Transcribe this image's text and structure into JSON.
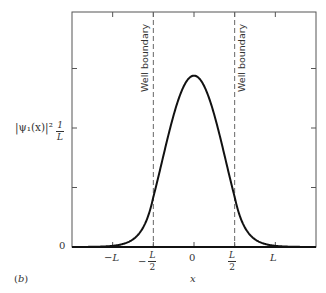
{
  "figure": {
    "panel_label": "(b)",
    "x_axis_label": "x",
    "y_axis_label": "|ψ₁(x)|²",
    "boundary_label": "Well boundary"
  },
  "chart_data": {
    "type": "line",
    "title": "",
    "panel": "(b)",
    "xlabel": "x",
    "ylabel": "|ψ₁(x)|²",
    "x_unit": "L",
    "y_unit": "1/L",
    "xlim": [
      -1.5,
      1.5
    ],
    "ylim": [
      0,
      2.0
    ],
    "grid": false,
    "legend": null,
    "x_ticks": [
      {
        "value": -1.0,
        "label": "-L"
      },
      {
        "value": -0.5,
        "label": "-L/2"
      },
      {
        "value": 0.0,
        "label": "0"
      },
      {
        "value": 0.5,
        "label": "L/2"
      },
      {
        "value": 1.0,
        "label": "L"
      }
    ],
    "y_ticks": [
      {
        "value": 0,
        "label": "0"
      },
      {
        "value": 0.5,
        "label": ""
      },
      {
        "value": 1.0,
        "label": "1/L"
      },
      {
        "value": 1.5,
        "label": ""
      }
    ],
    "annotations": [
      {
        "type": "vline",
        "x": -0.5,
        "style": "dashed",
        "text": "Well boundary"
      },
      {
        "type": "vline",
        "x": 0.5,
        "style": "dashed",
        "text": "Well boundary"
      }
    ],
    "series": [
      {
        "name": "|ψ₁(x)|² (finite well ground state)",
        "x": [
          -1.5,
          -1.25,
          -1.0,
          -0.9,
          -0.8,
          -0.7,
          -0.6,
          -0.5,
          -0.4,
          -0.3,
          -0.2,
          -0.1,
          0.0,
          0.1,
          0.2,
          0.3,
          0.4,
          0.5,
          0.6,
          0.7,
          0.8,
          0.9,
          1.0,
          1.25,
          1.5
        ],
        "values": [
          0.0,
          0.0,
          0.003,
          0.008,
          0.018,
          0.04,
          0.11,
          0.29,
          0.56,
          0.88,
          1.18,
          1.38,
          1.44,
          1.38,
          1.18,
          0.88,
          0.56,
          0.29,
          0.11,
          0.04,
          0.018,
          0.008,
          0.003,
          0.0,
          0.0
        ]
      }
    ]
  }
}
